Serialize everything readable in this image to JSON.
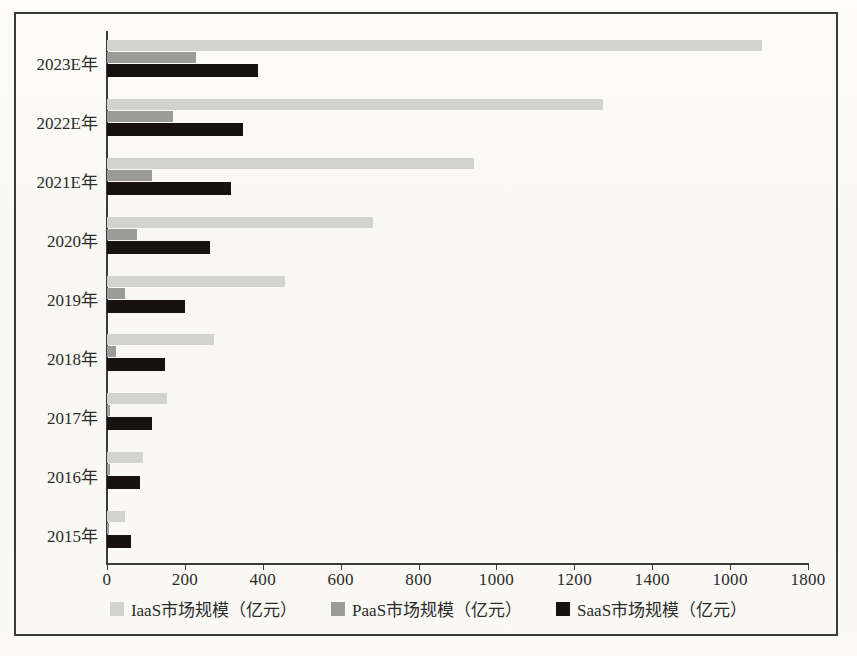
{
  "chart_data": {
    "type": "bar",
    "orientation": "horizontal",
    "title": "",
    "xlabel": "",
    "ylabel": "",
    "xlim": [
      0,
      1800
    ],
    "xticks": [
      0,
      200,
      400,
      600,
      800,
      1000,
      1200,
      1400,
      1000,
      1800
    ],
    "grid": false,
    "legend_position": "bottom",
    "categories": [
      "2015年",
      "2016年",
      "2017年",
      "2018年",
      "2019年",
      "2020年",
      "2021E年",
      "2022E年",
      "2023E年"
    ],
    "series": [
      {
        "name": "IaaS市场规模（亿元）",
        "color": "#d2d2cf",
        "values": [
          47,
          93,
          154,
          275,
          457,
          683,
          942,
          1274,
          1683
        ]
      },
      {
        "name": "PaaS市场规模（亿元）",
        "color": "#9b9b99",
        "values": [
          5,
          8,
          8,
          23,
          46,
          77,
          116,
          170,
          228
        ]
      },
      {
        "name": "SaaS市场规模（亿元）",
        "color": "#171110",
        "values": [
          62,
          85,
          116,
          149,
          200,
          265,
          318,
          350,
          388
        ]
      }
    ]
  },
  "axis": {
    "tick_labels": [
      "0",
      "200",
      "400",
      "600",
      "800",
      "1000",
      "1200",
      "1400",
      "1000",
      "1800"
    ]
  },
  "legend": {
    "items": [
      {
        "label": "IaaS市场规模（亿元）",
        "swatch": "iaas"
      },
      {
        "label": "PaaS市场规模（亿元）",
        "swatch": "paas"
      },
      {
        "label": "SaaS市场规模（亿元）",
        "swatch": "saas"
      }
    ]
  }
}
